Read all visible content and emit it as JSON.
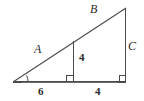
{
  "figure": {
    "kind": "geometry-diagram",
    "stroke_color": "#4a4a4a",
    "label_color": "#2b2b2b",
    "background_color": "#ffffff",
    "baseline_tint": "#8fae8f",
    "labels": {
      "hypotenuse_left": "A",
      "hypotenuse_right": "B",
      "right_side": "C",
      "inner_height": "4",
      "base_left": "6",
      "base_right": "4"
    },
    "marks": {
      "right_angle_inner": "right-angle-square",
      "right_angle_corner": "right-angle-square",
      "vertex_angle": "angle-arc"
    },
    "geometry": {
      "apex_top": [
        126,
        8
      ],
      "vertex_left": [
        13,
        82
      ],
      "corner_bottom_right": [
        126,
        82
      ],
      "foot_of_altitude": [
        73,
        82
      ],
      "altitude_top": [
        73,
        41
      ]
    }
  }
}
